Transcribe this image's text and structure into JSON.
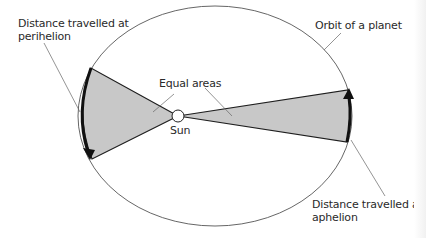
{
  "labels": {
    "perihelion_line1": "Distance travelled at",
    "perihelion_line2": "perihelion",
    "orbit": "Orbit of a planet",
    "equal_areas": "Equal areas",
    "sun": "Sun",
    "aphelion_line1": "Distance travelled at",
    "aphelion_line2": "aphelion"
  },
  "colors": {
    "background": "#ffffff",
    "orbit_line": "#444444",
    "sector_fill": "#c8c8c8",
    "sector_edge": "#1e1e1e",
    "arrow": "#111111",
    "sun_fill": "#ffffff",
    "text": "#2a2a2a"
  },
  "geometry": {
    "orbit": {
      "cx": 215,
      "cy": 116,
      "rx": 137,
      "ry": 110
    },
    "sun": {
      "cx": 178,
      "cy": 116,
      "r": 6
    },
    "perihelion_sector": {
      "arc_start": [
        91,
        68
      ],
      "arc_end": [
        92,
        159
      ]
    },
    "aphelion_sector": {
      "arc_start": [
        347,
        142
      ],
      "arc_end": [
        348,
        90
      ]
    }
  }
}
